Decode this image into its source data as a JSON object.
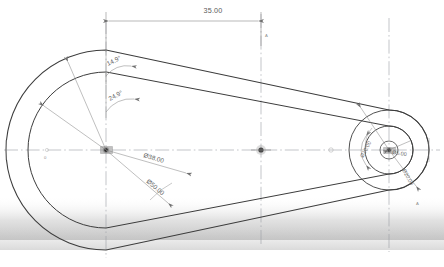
{
  "drawing": {
    "title": "Cam profile sketch",
    "background_color": "#ffffff",
    "outline_color": "#3c3c3c",
    "dimension_color": "#7a7a7a",
    "centerline_color": "#9aa0a6",
    "shadow_color": "#b9b9b9"
  },
  "dimensions": {
    "linear": [
      {
        "id": "center-distance",
        "value": "35.00",
        "x": 213,
        "y": 13
      }
    ],
    "angular": [
      {
        "id": "outer-tangent-angle",
        "value": "14.9°",
        "x": 108,
        "y": 66
      },
      {
        "id": "inner-tangent-angle",
        "value": "24.9°",
        "x": 110,
        "y": 101
      }
    ],
    "diameters": [
      {
        "id": "large-inner-dia",
        "value": "Ø38.00",
        "x": 143,
        "y": 157
      },
      {
        "id": "large-outer-dia",
        "value": "Ø50.00",
        "x": 150,
        "y": 180
      },
      {
        "id": "small-outer-dia",
        "value": "Ø10.00",
        "x": 369,
        "y": 155
      },
      {
        "id": "small-inner-dia",
        "value": "Ø5.00",
        "x": 394,
        "y": 152
      },
      {
        "id": "small-boss-dia",
        "value": "Ø20.00",
        "x": 404,
        "y": 172
      }
    ]
  },
  "geometry": {
    "large_circle": {
      "cx": 106,
      "cy": 150,
      "r_outer": 100,
      "r_inner": 78
    },
    "small_circle": {
      "cx": 389,
      "cy": 150,
      "r_outer": 40,
      "r_inner": 24,
      "r_bore": 9,
      "r_hub": 5
    },
    "mid_marker": {
      "cx": 261,
      "cy": 150,
      "r": 4
    }
  },
  "markers": {
    "left_tick": "⌐",
    "right_tick": "A",
    "mid_dot": "•"
  },
  "annotations": {
    "left_edge_label": "0",
    "right_edge_label": "A",
    "top_node_label": "A"
  }
}
